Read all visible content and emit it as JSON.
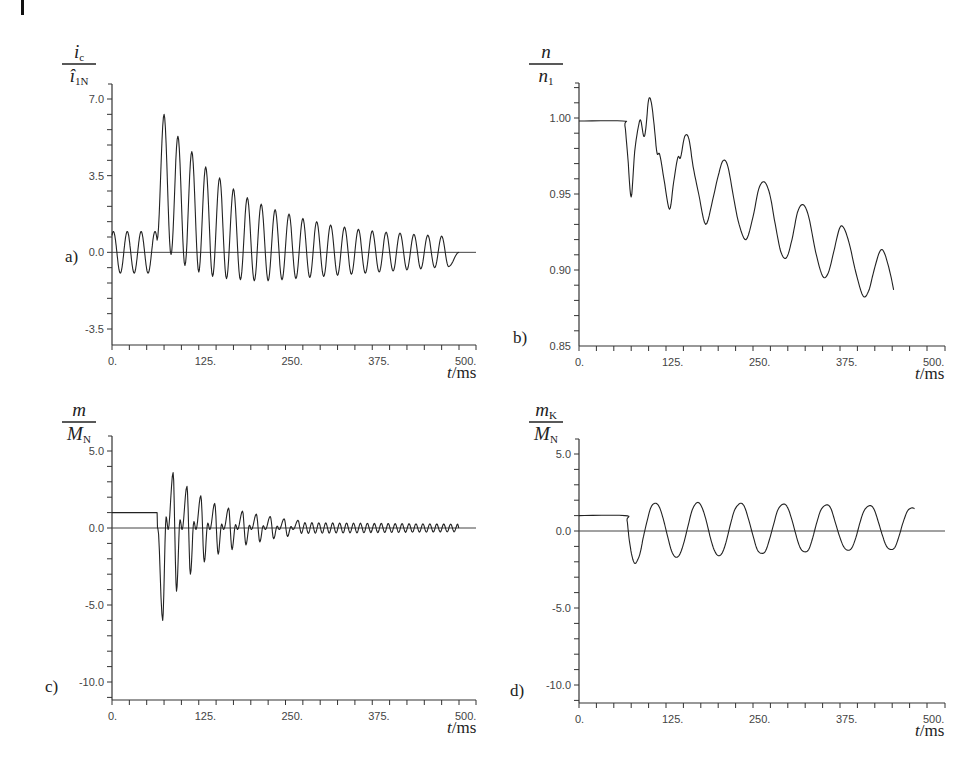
{
  "figure": {
    "corner_mark": "page-margin-bar"
  },
  "chart_data": [
    {
      "id": "a",
      "type": "line",
      "panel_label": "a)",
      "title": "",
      "ylabel_num": "i",
      "ylabel_num_sub": "c",
      "ylabel_den": "î",
      "ylabel_den_sub": "1N",
      "xlabel_italic": "t",
      "xlabel_unit": "/ms",
      "xlim": [
        0,
        525
      ],
      "ylim": [
        -4.6,
        7.7
      ],
      "xticks": [
        0,
        125,
        250,
        375,
        500
      ],
      "xtick_labels": [
        "0.",
        "125.",
        "250.",
        "375.",
        "500."
      ],
      "x_minor_step": 25,
      "yticks": [
        7.0,
        3.5,
        0.0,
        -3.5
      ],
      "ytick_labels": [
        "7.0",
        "3.5",
        "0.0",
        "-3.5"
      ],
      "y_minor_step": 0.7,
      "zero_line": true,
      "grid": false,
      "series": [
        {
          "name": "ic/î1N",
          "model": "pre: sinusoid 50Hz amp 0.95 until t=65ms; post: DC offset decaying + sinusoid",
          "period_ms": 20,
          "pre_fault": {
            "t_end": 65,
            "amp": 0.95
          },
          "peaks": [
            {
              "t": 75,
              "v": 6.3
            },
            {
              "t": 95,
              "v": 5.3
            },
            {
              "t": 115,
              "v": 4.6
            },
            {
              "t": 135,
              "v": 3.9
            },
            {
              "t": 155,
              "v": 3.4
            },
            {
              "t": 175,
              "v": 2.9
            },
            {
              "t": 195,
              "v": 2.5
            },
            {
              "t": 215,
              "v": 2.2
            },
            {
              "t": 235,
              "v": 1.95
            },
            {
              "t": 255,
              "v": 1.75
            },
            {
              "t": 275,
              "v": 1.55
            },
            {
              "t": 295,
              "v": 1.4
            },
            {
              "t": 315,
              "v": 1.25
            },
            {
              "t": 335,
              "v": 1.15
            },
            {
              "t": 355,
              "v": 1.05
            },
            {
              "t": 375,
              "v": 0.98
            },
            {
              "t": 395,
              "v": 0.92
            },
            {
              "t": 415,
              "v": 0.88
            },
            {
              "t": 435,
              "v": 0.82
            },
            {
              "t": 455,
              "v": 0.78
            },
            {
              "t": 475,
              "v": 0.74
            }
          ],
          "troughs": [
            {
              "t": 85,
              "v": -0.1
            },
            {
              "t": 105,
              "v": -0.6
            },
            {
              "t": 125,
              "v": -0.9
            },
            {
              "t": 145,
              "v": -1.1
            },
            {
              "t": 165,
              "v": -1.2
            },
            {
              "t": 185,
              "v": -1.25
            },
            {
              "t": 205,
              "v": -1.3
            },
            {
              "t": 225,
              "v": -1.3
            },
            {
              "t": 245,
              "v": -1.25
            },
            {
              "t": 265,
              "v": -1.2
            },
            {
              "t": 285,
              "v": -1.15
            },
            {
              "t": 305,
              "v": -1.1
            },
            {
              "t": 325,
              "v": -1.05
            },
            {
              "t": 345,
              "v": -1.0
            },
            {
              "t": 365,
              "v": -0.95
            },
            {
              "t": 385,
              "v": -0.9
            },
            {
              "t": 405,
              "v": -0.85
            },
            {
              "t": 425,
              "v": -0.8
            },
            {
              "t": 445,
              "v": -0.75
            },
            {
              "t": 465,
              "v": -0.7
            },
            {
              "t": 485,
              "v": -0.65
            }
          ],
          "t_end": 500
        }
      ]
    },
    {
      "id": "b",
      "type": "line",
      "panel_label": "b)",
      "title": "",
      "ylabel_num": "n",
      "ylabel_num_sub": "",
      "ylabel_den": "n",
      "ylabel_den_sub": "1",
      "xlabel_italic": "t",
      "xlabel_unit": "/ms",
      "xlim": [
        0,
        525
      ],
      "ylim": [
        0.85,
        1.025
      ],
      "xticks": [
        0,
        125,
        250,
        375,
        500
      ],
      "xtick_labels": [
        "0.",
        "125.",
        "250.",
        "375.",
        "500."
      ],
      "x_minor_step": 25,
      "yticks": [
        1.0,
        0.95,
        0.9,
        0.85
      ],
      "ytick_labels": [
        "1.00",
        "0.95",
        "0.90",
        "0.85"
      ],
      "y_minor_step": 0.01,
      "zero_line": false,
      "grid": false,
      "series": [
        {
          "name": "n/n1",
          "points": [
            [
              0,
              0.998
            ],
            [
              63,
              0.998
            ],
            [
              66,
              0.995
            ],
            [
              70,
              0.975
            ],
            [
              75,
              0.948
            ],
            [
              80,
              0.978
            ],
            [
              86,
              0.996
            ],
            [
              89,
              0.998
            ],
            [
              93,
              0.988
            ],
            [
              96,
              0.993
            ],
            [
              100,
              1.012
            ],
            [
              104,
              1.01
            ],
            [
              108,
              0.995
            ],
            [
              112,
              0.977
            ],
            [
              116,
              0.976
            ],
            [
              122,
              0.96
            ],
            [
              130,
              0.94
            ],
            [
              136,
              0.958
            ],
            [
              142,
              0.974
            ],
            [
              146,
              0.974
            ],
            [
              152,
              0.988
            ],
            [
              158,
              0.986
            ],
            [
              164,
              0.968
            ],
            [
              172,
              0.95
            ],
            [
              182,
              0.93
            ],
            [
              192,
              0.946
            ],
            [
              200,
              0.962
            ],
            [
              207,
              0.972
            ],
            [
              214,
              0.968
            ],
            [
              222,
              0.948
            ],
            [
              230,
              0.93
            ],
            [
              240,
              0.92
            ],
            [
              250,
              0.935
            ],
            [
              258,
              0.953
            ],
            [
              266,
              0.958
            ],
            [
              274,
              0.95
            ],
            [
              282,
              0.93
            ],
            [
              290,
              0.912
            ],
            [
              298,
              0.908
            ],
            [
              306,
              0.92
            ],
            [
              314,
              0.938
            ],
            [
              322,
              0.943
            ],
            [
              330,
              0.935
            ],
            [
              340,
              0.912
            ],
            [
              350,
              0.896
            ],
            [
              358,
              0.898
            ],
            [
              366,
              0.912
            ],
            [
              374,
              0.927
            ],
            [
              380,
              0.928
            ],
            [
              388,
              0.918
            ],
            [
              398,
              0.898
            ],
            [
              408,
              0.883
            ],
            [
              416,
              0.886
            ],
            [
              424,
              0.9
            ],
            [
              432,
              0.912
            ],
            [
              438,
              0.912
            ],
            [
              446,
              0.9
            ],
            [
              452,
              0.887
            ]
          ]
        }
      ]
    },
    {
      "id": "c",
      "type": "line",
      "panel_label": "c)",
      "title": "",
      "ylabel_num": "m",
      "ylabel_num_sub": "",
      "ylabel_den": "M",
      "ylabel_den_sub": "N",
      "xlabel_italic": "t",
      "xlabel_unit": "/ms",
      "xlim": [
        0,
        525
      ],
      "ylim": [
        -11.2,
        6.0
      ],
      "xticks": [
        0,
        125,
        250,
        375,
        500
      ],
      "xtick_labels": [
        "0.",
        "125.",
        "250.",
        "375.",
        "500."
      ],
      "x_minor_step": 25,
      "yticks": [
        5.0,
        0.0,
        -5.0,
        -10.0
      ],
      "ytick_labels": [
        "5.0",
        "0.0",
        "-5.0",
        "-10.0"
      ],
      "y_minor_step": 1.0,
      "zero_line": true,
      "grid": false,
      "series": [
        {
          "name": "m/MN",
          "pre_fault": {
            "t_end": 65,
            "v": 1.0
          },
          "period_ms": 20,
          "extrema": [
            {
              "t": 73,
              "min": -6.0,
              "max": 3.6
            },
            {
              "t": 93,
              "min": -4.1,
              "max": 2.7
            },
            {
              "t": 113,
              "min": -3.0,
              "max": 2.1
            },
            {
              "t": 133,
              "min": -2.2,
              "max": 1.6
            },
            {
              "t": 153,
              "min": -1.7,
              "max": 1.3
            },
            {
              "t": 173,
              "min": -1.4,
              "max": 1.1
            },
            {
              "t": 193,
              "min": -1.1,
              "max": 0.9
            },
            {
              "t": 213,
              "min": -0.9,
              "max": 0.75
            },
            {
              "t": 233,
              "min": -0.7,
              "max": 0.6
            },
            {
              "t": 253,
              "min": -0.55,
              "max": 0.5
            }
          ],
          "tail_amp": 0.35,
          "t_end": 500
        }
      ]
    },
    {
      "id": "d",
      "type": "line",
      "panel_label": "d)",
      "title": "",
      "ylabel_num": "m",
      "ylabel_num_sub": "K",
      "ylabel_den": "M",
      "ylabel_den_sub": "N",
      "xlabel_italic": "t",
      "xlabel_unit": "/ms",
      "xlim": [
        0,
        525
      ],
      "ylim": [
        -11.2,
        6.0
      ],
      "xticks": [
        0,
        125,
        250,
        375,
        500
      ],
      "xtick_labels": [
        "0.",
        "125.",
        "250.",
        "375.",
        "500."
      ],
      "x_minor_step": 25,
      "yticks": [
        5.0,
        0.0,
        -5.0,
        -10.0
      ],
      "ytick_labels": [
        "5.0",
        "0.0",
        "-5.0",
        "-10.0"
      ],
      "y_minor_step": 1.0,
      "zero_line": true,
      "grid": false,
      "series": [
        {
          "name": "mK/MN",
          "points": [
            [
              0,
              1.0
            ],
            [
              66,
              1.0
            ],
            [
              69,
              0.7
            ],
            [
              72,
              -0.5
            ],
            [
              76,
              -1.6
            ],
            [
              80,
              -2.1
            ],
            [
              84,
              -1.9
            ],
            [
              88,
              -1.4
            ],
            [
              92,
              -0.5
            ],
            [
              97,
              0.5
            ],
            [
              103,
              1.5
            ],
            [
              109,
              1.8
            ],
            [
              115,
              1.6
            ],
            [
              121,
              0.8
            ],
            [
              127,
              -0.3
            ],
            [
              133,
              -1.3
            ],
            [
              139,
              -1.7
            ],
            [
              145,
              -1.5
            ],
            [
              151,
              -0.7
            ],
            [
              157,
              0.4
            ],
            [
              163,
              1.4
            ],
            [
              170,
              1.85
            ],
            [
              176,
              1.6
            ],
            [
              182,
              0.8
            ],
            [
              188,
              -0.3
            ],
            [
              194,
              -1.2
            ],
            [
              200,
              -1.6
            ],
            [
              206,
              -1.4
            ],
            [
              212,
              -0.6
            ],
            [
              218,
              0.5
            ],
            [
              224,
              1.4
            ],
            [
              232,
              1.8
            ],
            [
              238,
              1.55
            ],
            [
              244,
              0.7
            ],
            [
              250,
              -0.3
            ],
            [
              256,
              -1.2
            ],
            [
              262,
              -1.45
            ],
            [
              268,
              -1.3
            ],
            [
              274,
              -0.5
            ],
            [
              280,
              0.5
            ],
            [
              286,
              1.4
            ],
            [
              294,
              1.75
            ],
            [
              300,
              1.5
            ],
            [
              306,
              0.7
            ],
            [
              312,
              -0.3
            ],
            [
              318,
              -1.1
            ],
            [
              324,
              -1.35
            ],
            [
              330,
              -1.2
            ],
            [
              336,
              -0.4
            ],
            [
              342,
              0.6
            ],
            [
              348,
              1.4
            ],
            [
              356,
              1.7
            ],
            [
              362,
              1.45
            ],
            [
              368,
              0.6
            ],
            [
              374,
              -0.3
            ],
            [
              380,
              -1.0
            ],
            [
              386,
              -1.25
            ],
            [
              392,
              -1.1
            ],
            [
              398,
              -0.4
            ],
            [
              404,
              0.6
            ],
            [
              410,
              1.35
            ],
            [
              418,
              1.65
            ],
            [
              424,
              1.4
            ],
            [
              430,
              0.6
            ],
            [
              436,
              -0.3
            ],
            [
              442,
              -1.0
            ],
            [
              448,
              -1.2
            ],
            [
              454,
              -1.05
            ],
            [
              460,
              -0.3
            ],
            [
              466,
              0.6
            ],
            [
              472,
              1.3
            ],
            [
              478,
              1.5
            ],
            [
              482,
              1.45
            ]
          ]
        }
      ]
    }
  ]
}
